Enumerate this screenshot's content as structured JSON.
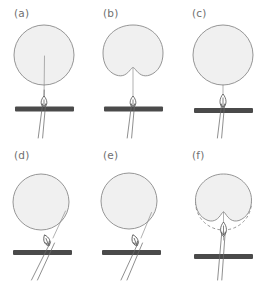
{
  "figure": {
    "type": "diagram",
    "width": 268,
    "height": 284,
    "background": "#ffffff",
    "grid": {
      "columns": 3,
      "rows": 2
    }
  },
  "colors": {
    "droplet_fill": "#f0f0f0",
    "droplet_stroke": "#8a8a8a",
    "substrate_bar": "#4a4a4a",
    "fiber": "#6a6a6a",
    "loop_stroke": "#4f4f4f",
    "label_text": "#6f6f6f",
    "dashed_outline": "#8a8a8a"
  },
  "legend_elements": {
    "droplet": "droplet",
    "substrate": "substrate-bar",
    "fiber": "fiber-filament",
    "loop": "loop-probe",
    "dashed": "original-outline"
  },
  "panels": [
    {
      "id": "a",
      "label": "(a)",
      "shape": "circle",
      "shape_state": "undeformed",
      "fiber_orientation": "vertical",
      "fiber_contact": "pierces-droplet-center",
      "loop_present": true,
      "dashed_outline": false,
      "notes": "Vertical fiber penetrates the droplet from below; loop sits above the substrate bar."
    },
    {
      "id": "b",
      "label": "(b)",
      "shape": "notched",
      "shape_state": "deformed-v-notch",
      "fiber_orientation": "vertical",
      "fiber_contact": "apex-of-notch",
      "loop_present": true,
      "dashed_outline": false,
      "notes": "Droplet bottom is drawn upward into a deep V-shaped notch by the vertical fiber."
    },
    {
      "id": "c",
      "label": "(c)",
      "shape": "circle",
      "shape_state": "undeformed-detached",
      "fiber_orientation": "vertical",
      "fiber_contact": "tangent-bottom",
      "loop_present": true,
      "dashed_outline": false,
      "notes": "Droplet relaxed back to a circle, resting just on the fiber tip above the loop."
    },
    {
      "id": "d",
      "label": "(d)",
      "shape": "circle",
      "shape_state": "undeformed",
      "fiber_orientation": "tilted",
      "fiber_contact": "right-side-tangent",
      "loop_present": true,
      "dashed_outline": false,
      "notes": "Fiber approaches at an oblique angle and touches the lower-right of the droplet."
    },
    {
      "id": "e",
      "label": "(e)",
      "shape": "circle",
      "shape_state": "undeformed",
      "fiber_orientation": "tilted",
      "fiber_contact": "lower-right-tangent",
      "loop_present": true,
      "dashed_outline": false,
      "notes": "Tilted fiber runs tangent along the lower-right boundary of the droplet."
    },
    {
      "id": "f",
      "label": "(f)",
      "shape": "notched",
      "shape_state": "deformed-v-notch",
      "fiber_orientation": "vertical",
      "fiber_contact": "apex-of-notch",
      "loop_present": true,
      "dashed_outline": true,
      "notes": "Droplet notched by the fiber; dashed arc marks the original undeformed circular boundary."
    }
  ]
}
